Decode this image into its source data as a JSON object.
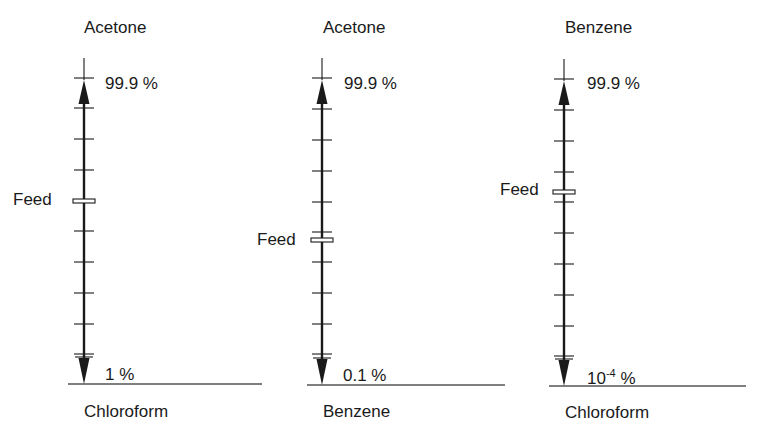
{
  "columns": [
    {
      "x": 84,
      "top_component": "Acetone",
      "bottom_component": "Chloroform",
      "top_purity": "99.9 %",
      "bottom_purity_base": "1 %",
      "bottom_purity_sup": "",
      "feed_label": "Feed",
      "feed_y": 201,
      "line_top": 58,
      "baseline_y": 384,
      "baseline_x1": 68,
      "baseline_x2": 262,
      "ticks": [
        78,
        108,
        139,
        170,
        231,
        262,
        293,
        324,
        354
      ]
    },
    {
      "x": 322,
      "top_component": "Acetone",
      "bottom_component": "Benzene",
      "top_purity": "99.9 %",
      "bottom_purity_base": "0.1 %",
      "bottom_purity_sup": "",
      "feed_label": "Feed",
      "feed_y": 240,
      "line_top": 58,
      "baseline_y": 385,
      "baseline_x1": 307,
      "baseline_x2": 505,
      "ticks": [
        78,
        109,
        140,
        171,
        202,
        232,
        262,
        293,
        324,
        354
      ]
    },
    {
      "x": 564,
      "top_component": "Benzene",
      "bottom_component": "Chloroform",
      "top_purity": "99.9 %",
      "bottom_purity_base": "10",
      "bottom_purity_sup": "-4",
      "bottom_purity_suffix": " %",
      "feed_label": "Feed",
      "feed_y": 192,
      "line_top": 59,
      "baseline_y": 386,
      "baseline_x1": 549,
      "baseline_x2": 746,
      "ticks": [
        79,
        110,
        141,
        172,
        202,
        233,
        264,
        295,
        326,
        356
      ]
    }
  ],
  "colors": {
    "line": "#1a1a1a",
    "baseline": "#555555",
    "background": "#ffffff"
  }
}
